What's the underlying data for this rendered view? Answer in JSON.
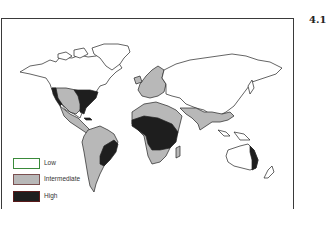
{
  "figure": {
    "number": "4.1",
    "type": "world choropleth map"
  },
  "legend": {
    "items": [
      {
        "label": "Low",
        "color": "#ffffff",
        "border": "#3a8a3a"
      },
      {
        "label": "Intermediate",
        "color": "#b8b8b8",
        "border": "#7a5050"
      },
      {
        "label": "High",
        "color": "#1e1e1e",
        "border": "#5a1a1a"
      }
    ]
  },
  "regions": {
    "high": [
      "Eastern United States",
      "Western coast of Mexico/US",
      "Eastern Brazil",
      "Central Africa",
      "Eastern Australia coast"
    ],
    "intermediate": [
      "Western/Central United States",
      "Mexico and Central America",
      "South America",
      "Europe",
      "Sahel / North Africa band",
      "Southern Africa",
      "South Asia / India",
      "Southeast Asia"
    ],
    "low": [
      "Canada",
      "Greenland",
      "Russia / Northern Asia",
      "Central Asia",
      "Australia interior"
    ]
  }
}
